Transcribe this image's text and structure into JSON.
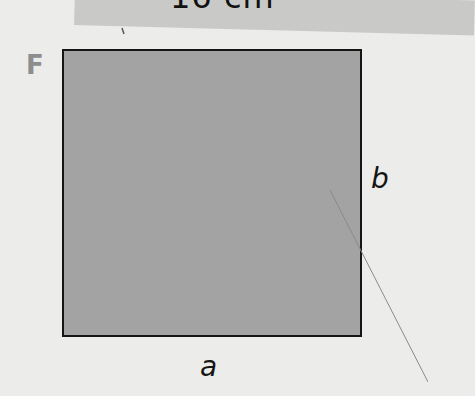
{
  "header": {
    "measurement_label": "16 cm"
  },
  "figure": {
    "shape_letter": "F",
    "shape": "square",
    "fill_color": "#a3a3a3",
    "border_color": "#151515",
    "side_labels": {
      "bottom": "a",
      "right": "b"
    }
  }
}
